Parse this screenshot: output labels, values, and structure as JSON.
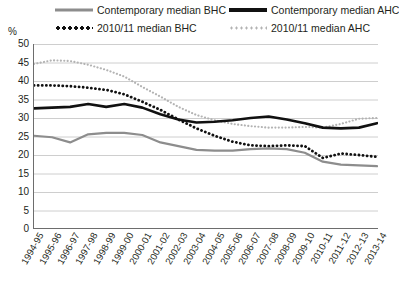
{
  "axis": {
    "y_unit_label": "%",
    "y_ticks": [
      50,
      45,
      40,
      35,
      30,
      25,
      20,
      15,
      10,
      5,
      0
    ]
  },
  "legend": {
    "items": [
      {
        "id": "contemporary-bhc",
        "label": "Contemporary median BHC",
        "style": "solid",
        "color": "#8d8d8d"
      },
      {
        "id": "contemporary-ahc",
        "label": "Contemporary median AHC",
        "style": "solid",
        "color": "#111111"
      },
      {
        "id": "2010-bhc",
        "label": "2010/11 median BHC",
        "style": "dotted",
        "color": "#111111"
      },
      {
        "id": "2010-ahc",
        "label": "2010/11 median AHC",
        "style": "dotted",
        "color": "#b3b3b3"
      }
    ]
  },
  "chart_data": {
    "type": "line",
    "title": "",
    "xlabel": "",
    "ylabel": "%",
    "ylim": [
      0,
      50
    ],
    "ytick_step": 5,
    "grid": true,
    "legend_position": "top",
    "categories": [
      "1994-95",
      "1995-96",
      "1996-97",
      "1997-98",
      "1998-99",
      "1999-00",
      "2000-01",
      "2001-02",
      "2002-03",
      "2003-04",
      "2004-05",
      "2005-06",
      "2006-07",
      "2007-08",
      "2008-09",
      "2009-10",
      "2010-11",
      "2011-12",
      "2012-13",
      "2013-14"
    ],
    "series": [
      {
        "name": "Contemporary median BHC",
        "color": "#8d8d8d",
        "style": "solid",
        "values": [
          25.2,
          24.8,
          23.4,
          25.6,
          26.0,
          26.0,
          25.4,
          23.4,
          22.4,
          21.4,
          21.2,
          21.2,
          21.6,
          21.8,
          21.6,
          20.6,
          18.2,
          17.4,
          17.2,
          17.0
        ]
      },
      {
        "name": "Contemporary median AHC",
        "color": "#111111",
        "style": "solid",
        "values": [
          32.6,
          32.8,
          33.0,
          33.8,
          33.0,
          33.8,
          32.8,
          31.0,
          29.6,
          28.8,
          29.0,
          29.4,
          30.0,
          30.4,
          29.6,
          28.6,
          27.4,
          27.2,
          27.4,
          28.6
        ]
      },
      {
        "name": "2010/11 median BHC",
        "color": "#111111",
        "style": "dotted",
        "values": [
          38.8,
          38.8,
          38.6,
          38.2,
          37.6,
          36.4,
          34.4,
          32.2,
          29.6,
          27.2,
          25.2,
          23.6,
          22.6,
          22.4,
          22.6,
          22.4,
          19.2,
          20.4,
          20.0,
          19.5
        ]
      },
      {
        "name": "2010/11 median AHC",
        "color": "#b3b3b3",
        "style": "dotted",
        "values": [
          44.6,
          45.6,
          45.4,
          44.4,
          43.0,
          41.2,
          38.4,
          35.8,
          33.0,
          30.8,
          29.4,
          28.4,
          27.8,
          27.4,
          27.4,
          27.6,
          27.4,
          28.4,
          29.8,
          30.0
        ]
      }
    ]
  }
}
